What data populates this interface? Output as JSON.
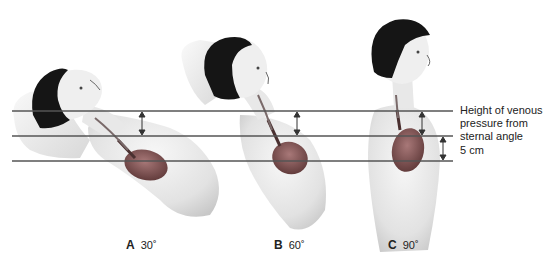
{
  "diagram": {
    "annotations": {
      "venous_label": "Height of venous pressure from sternal angle",
      "venous_label_lines": [
        "Height of venous",
        "pressure from",
        "sternal angle"
      ],
      "distance_label": "5 cm"
    },
    "panels": [
      {
        "letter": "A",
        "angle": "30˚",
        "description": "Patient reclined at 30 degrees"
      },
      {
        "letter": "B",
        "angle": "60˚",
        "description": "Patient reclined at 60 degrees"
      },
      {
        "letter": "C",
        "angle": "90˚",
        "description": "Patient upright at 90 degrees"
      }
    ],
    "reference_lines": [
      {
        "name": "venous-pressure-level",
        "y": 111
      },
      {
        "name": "sternal-angle-level",
        "y": 136
      },
      {
        "name": "right-atrium-level",
        "y": 161
      }
    ],
    "colors": {
      "line": "#555555",
      "hair": "#1a1a1a",
      "skin": "#e4e4e4",
      "heart": "#8a5a5a",
      "text": "#222222"
    }
  }
}
